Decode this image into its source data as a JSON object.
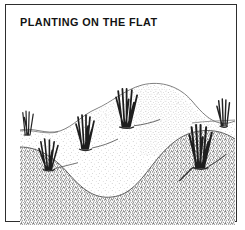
{
  "figure": {
    "title": "PLANTING ON THE FLAT",
    "medium": "pen-and-ink stipple line drawing",
    "frame": {
      "border_color": "#2e2e2e",
      "background": "#ffffff"
    },
    "palette": {
      "ink": "#1c1c1c",
      "stipple_dark": "#555555",
      "stipple_light": "#9a9a9a",
      "paper": "#ffffff"
    }
  },
  "illustration": {
    "caption_label": "PLANTING ON THE FLAT",
    "scene_description": "Cross-section landscape drawing of a low sandy mound with grass plants set on the flat ground surface, showing stippled topsoil above a darker stippled subsoil layer.",
    "elements": [
      {
        "name": "ground-surface-line",
        "label": "flat ground surface"
      },
      {
        "name": "sand-mound",
        "label": "stippled sand mound"
      },
      {
        "name": "subsoil-layer",
        "label": "dark stippled subsoil"
      },
      {
        "name": "plant-tuft",
        "label": "grass tuft planted on the flat",
        "count": 6
      }
    ],
    "plant_tufts": [
      {
        "id": 1,
        "x": 20,
        "y": 108,
        "height": 30,
        "blades": 7,
        "scale": 0.95
      },
      {
        "id": 2,
        "x": 56,
        "y": 86,
        "height": 34,
        "blades": 8,
        "scale": 1.0
      },
      {
        "id": 3,
        "x": 96,
        "y": 62,
        "height": 38,
        "blades": 8,
        "scale": 1.05
      },
      {
        "id": 4,
        "x": 1,
        "y": 74,
        "height": 26,
        "blades": 5,
        "scale": 0.8
      },
      {
        "id": 5,
        "x": 170,
        "y": 96,
        "height": 40,
        "blades": 8,
        "scale": 1.1
      },
      {
        "id": 6,
        "x": 198,
        "y": 70,
        "height": 30,
        "blades": 6,
        "scale": 0.9
      }
    ]
  }
}
